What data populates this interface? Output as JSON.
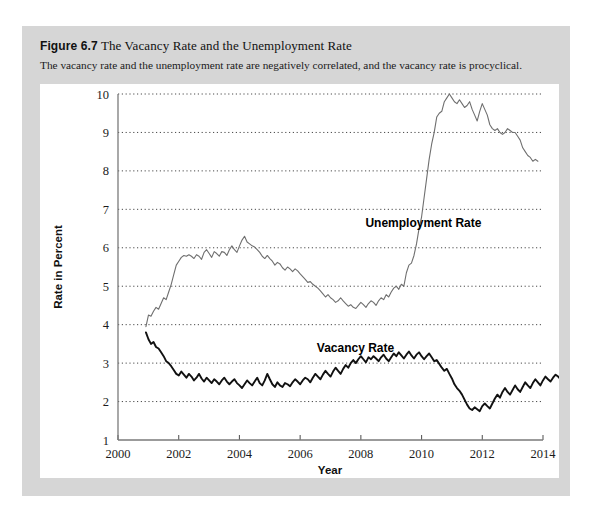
{
  "figure": {
    "number": "Figure 6.7",
    "title": "The Vacancy Rate and the Unemployment Rate",
    "subtitle": "The vacancy rate and the unemployment rate are negatively correlated, and the vacancy rate is procyclical."
  },
  "chart_data": {
    "type": "line",
    "title": "The Vacancy Rate and the Unemployment Rate",
    "xlabel": "Year",
    "ylabel": "Rate in Percent",
    "xlim": [
      2000,
      2014
    ],
    "ylim": [
      1,
      10
    ],
    "xticks": [
      "2000",
      "2002",
      "2004",
      "2006",
      "2008",
      "2010",
      "2012",
      "2014"
    ],
    "xtick_values": [
      2000,
      2002,
      2004,
      2006,
      2008,
      2010,
      2012,
      2014
    ],
    "yticks": [
      "1",
      "2",
      "3",
      "4",
      "5",
      "6",
      "7",
      "8",
      "9",
      "10"
    ],
    "ytick_values": [
      1,
      2,
      3,
      4,
      5,
      6,
      7,
      8,
      9,
      10
    ],
    "grid": "horizontal-dotted",
    "legend": "inline-labels",
    "series": [
      {
        "name": "Unemployment Rate",
        "color": "#6f6f6f",
        "label_position": {
          "x": 2008.15,
          "y": 6.55
        },
        "x_start": 2000.92,
        "x_step": 0.0833,
        "values": [
          3.95,
          4.25,
          4.22,
          4.35,
          4.45,
          4.4,
          4.55,
          4.7,
          4.65,
          4.85,
          5.05,
          5.3,
          5.55,
          5.65,
          5.75,
          5.8,
          5.78,
          5.82,
          5.78,
          5.72,
          5.82,
          5.78,
          5.7,
          5.88,
          5.95,
          5.85,
          5.75,
          5.9,
          5.85,
          5.78,
          5.9,
          5.88,
          5.8,
          5.95,
          6.05,
          5.95,
          5.88,
          6.05,
          6.2,
          6.3,
          6.15,
          6.1,
          6.05,
          6.02,
          5.95,
          5.88,
          5.78,
          5.72,
          5.8,
          5.72,
          5.65,
          5.55,
          5.62,
          5.58,
          5.48,
          5.42,
          5.5,
          5.45,
          5.38,
          5.45,
          5.4,
          5.32,
          5.25,
          5.18,
          5.1,
          5.12,
          5.05,
          5.0,
          4.95,
          4.88,
          4.8,
          4.72,
          4.78,
          4.7,
          4.65,
          4.58,
          4.62,
          4.7,
          4.62,
          4.55,
          4.48,
          4.52,
          4.45,
          4.42,
          4.5,
          4.58,
          4.52,
          4.45,
          4.55,
          4.62,
          4.58,
          4.5,
          4.62,
          4.7,
          4.65,
          4.78,
          4.72,
          4.85,
          4.95,
          5.0,
          4.92,
          5.05,
          5.0,
          5.35,
          5.55,
          5.6,
          5.8,
          6.1,
          6.5,
          6.8,
          7.3,
          7.8,
          8.3,
          8.7,
          9.0,
          9.4,
          9.5,
          9.55,
          9.8,
          9.9,
          10.0,
          9.9,
          9.8,
          9.75,
          9.85,
          9.75,
          9.65,
          9.7,
          9.8,
          9.6,
          9.45,
          9.3,
          9.55,
          9.75,
          9.6,
          9.45,
          9.2,
          9.1,
          9.05,
          9.1,
          9.0,
          8.95,
          9.0,
          9.1,
          9.05,
          9.0,
          9.0,
          8.9,
          8.8,
          8.6,
          8.5,
          8.4,
          8.35,
          8.25,
          8.3,
          8.25
        ]
      },
      {
        "name": "Vacancy Rate",
        "color": "#111111",
        "label_position": {
          "x": 2006.55,
          "y": 3.28
        },
        "x_start": 2000.92,
        "x_step": 0.0833,
        "values": [
          3.8,
          3.62,
          3.5,
          3.55,
          3.42,
          3.38,
          3.28,
          3.18,
          3.05,
          3.0,
          2.92,
          2.82,
          2.72,
          2.68,
          2.78,
          2.7,
          2.62,
          2.72,
          2.65,
          2.55,
          2.62,
          2.72,
          2.6,
          2.52,
          2.62,
          2.55,
          2.48,
          2.58,
          2.52,
          2.45,
          2.55,
          2.62,
          2.52,
          2.45,
          2.52,
          2.58,
          2.48,
          2.42,
          2.35,
          2.45,
          2.55,
          2.48,
          2.42,
          2.52,
          2.62,
          2.48,
          2.42,
          2.55,
          2.72,
          2.58,
          2.45,
          2.38,
          2.5,
          2.42,
          2.38,
          2.48,
          2.45,
          2.4,
          2.5,
          2.58,
          2.52,
          2.45,
          2.55,
          2.62,
          2.58,
          2.5,
          2.62,
          2.72,
          2.65,
          2.58,
          2.7,
          2.8,
          2.72,
          2.65,
          2.78,
          2.88,
          2.8,
          2.72,
          2.85,
          2.95,
          2.88,
          3.0,
          3.08,
          3.0,
          3.1,
          3.18,
          3.1,
          3.02,
          3.15,
          3.1,
          3.18,
          3.12,
          3.05,
          3.15,
          3.22,
          3.12,
          3.05,
          3.15,
          3.25,
          3.18,
          3.28,
          3.2,
          3.12,
          3.22,
          3.3,
          3.2,
          3.12,
          3.22,
          3.28,
          3.18,
          3.1,
          3.18,
          3.25,
          3.15,
          3.05,
          3.08,
          2.98,
          2.88,
          2.8,
          2.85,
          2.72,
          2.6,
          2.45,
          2.35,
          2.28,
          2.18,
          2.05,
          1.92,
          1.82,
          1.78,
          1.85,
          1.8,
          1.75,
          1.88,
          1.95,
          1.88,
          1.82,
          1.95,
          2.08,
          2.18,
          2.1,
          2.25,
          2.35,
          2.25,
          2.18,
          2.3,
          2.42,
          2.32,
          2.25,
          2.38,
          2.5,
          2.42,
          2.35,
          2.48,
          2.58,
          2.5,
          2.42,
          2.55,
          2.65,
          2.58,
          2.52,
          2.62,
          2.7,
          2.65,
          2.58,
          2.7
        ]
      }
    ]
  }
}
